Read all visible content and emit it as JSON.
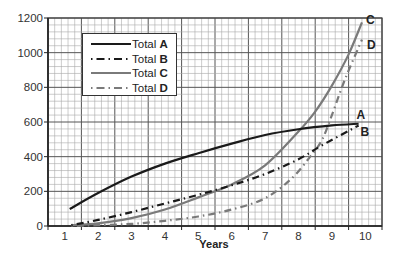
{
  "chart_data": {
    "type": "line",
    "title": "",
    "xlabel": "Years",
    "ylabel": "",
    "xlim": [
      0.5,
      10.5
    ],
    "ylim": [
      0,
      1200
    ],
    "x_ticks": [
      1,
      2,
      3,
      4,
      5,
      6,
      7,
      8,
      9,
      10
    ],
    "y_ticks": [
      0,
      200,
      400,
      600,
      800,
      1000,
      1200
    ],
    "grid": true,
    "legend_position": "upper-left",
    "series": [
      {
        "name": "Total A",
        "letter": "A",
        "style": "solid",
        "color": "#1a1a1a",
        "x": [
          1.15,
          2,
          3,
          4,
          5,
          6,
          7,
          8,
          9,
          9.8
        ],
        "values": [
          98,
          190,
          285,
          360,
          420,
          475,
          525,
          558,
          580,
          590
        ]
      },
      {
        "name": "Total B",
        "letter": "B",
        "style": "dash-dot",
        "color": "#1a1a1a",
        "x": [
          1.2,
          2,
          3,
          4,
          5,
          6,
          7,
          8,
          8.7,
          9.8
        ],
        "values": [
          5,
          35,
          80,
          130,
          180,
          235,
          300,
          385,
          465,
          580
        ]
      },
      {
        "name": "Total C",
        "letter": "C",
        "style": "solid",
        "color": "#7a7a7a",
        "x": [
          1.2,
          2,
          3,
          4,
          5,
          6,
          7,
          8,
          8.5,
          9,
          9.5,
          9.9
        ],
        "values": [
          5,
          15,
          45,
          95,
          165,
          240,
          350,
          545,
          660,
          810,
          990,
          1175
        ]
      },
      {
        "name": "Total D",
        "letter": "D",
        "style": "dash-dot",
        "color": "#7a7a7a",
        "x": [
          1.2,
          2,
          3,
          4,
          5,
          6,
          7,
          7.8,
          8.35,
          8.7,
          9,
          9.4,
          9.9
        ],
        "values": [
          0,
          5,
          12,
          30,
          55,
          95,
          160,
          275,
          400,
          495,
          640,
          850,
          1075
        ]
      }
    ],
    "end_labels": [
      "A",
      "B",
      "C",
      "D"
    ]
  },
  "legend": {
    "items": [
      {
        "prefix": "Total ",
        "letter": "A"
      },
      {
        "prefix": "Total ",
        "letter": "B"
      },
      {
        "prefix": "Total ",
        "letter": "C"
      },
      {
        "prefix": "Total ",
        "letter": "D"
      }
    ]
  }
}
